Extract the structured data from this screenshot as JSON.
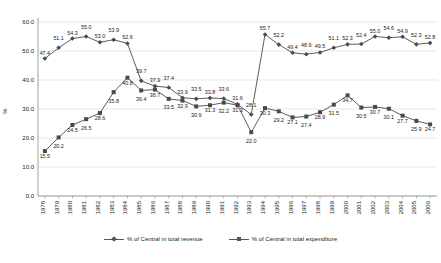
{
  "chart_data": {
    "type": "line",
    "title": "",
    "xlabel": "",
    "ylabel": "%",
    "ylim": [
      0,
      60
    ],
    "yticks": [
      0,
      10,
      20,
      30,
      40,
      50,
      60
    ],
    "ytick_labels": [
      "0.0",
      "10.0",
      "20.0",
      "30.0",
      "40.0",
      "50.0",
      "60.0"
    ],
    "grid": true,
    "legend_position": "bottom",
    "categories": [
      "1978",
      "1979",
      "1980",
      "1981",
      "1982",
      "1983",
      "1984",
      "1985",
      "1986",
      "1987",
      "1988",
      "1989",
      "1990",
      "1991",
      "1992",
      "1993",
      "1994",
      "1995",
      "1996",
      "1997",
      "1998",
      "1999",
      "2000",
      "2001",
      "2002",
      "2003",
      "2004",
      "2005",
      "2006"
    ],
    "series": [
      {
        "name": "% of Central in total revenue",
        "marker": "diamond",
        "color": "#4a4a4a",
        "values": [
          47.4,
          51.1,
          54.3,
          55.0,
          53.0,
          53.9,
          52.6,
          39.7,
          37.9,
          37.4,
          33.9,
          33.5,
          33.8,
          33.6,
          31.6,
          28.1,
          55.7,
          52.2,
          49.4,
          48.9,
          49.5,
          51.1,
          52.3,
          52.4,
          55.0,
          54.6,
          54.9,
          52.3,
          52.8
        ]
      },
      {
        "name": "% of Central in total expenditure",
        "marker": "square",
        "color": "#4a4a4a",
        "values": [
          15.5,
          20.2,
          24.5,
          26.5,
          28.6,
          35.8,
          40.8,
          36.4,
          36.7,
          33.5,
          32.9,
          30.9,
          31.3,
          32.2,
          31.3,
          22.0,
          30.3,
          29.2,
          27.1,
          27.4,
          28.9,
          31.5,
          34.7,
          30.5,
          30.7,
          30.1,
          27.7,
          25.9,
          24.7
        ]
      }
    ],
    "point_labels_revenue": [
      "47.4",
      "51.1",
      "54.3",
      "55.0",
      "53.0",
      "53.9",
      "52.6",
      "39.7",
      "37.9",
      "37.4",
      "33.9",
      "33.5",
      "33.8",
      "33.6",
      "31.6",
      "28.1",
      "55.7",
      "52.2",
      "49.4",
      "48.9",
      "49.5",
      "51.1",
      "52.3",
      "52.4",
      "55.0",
      "54.6",
      "54.9",
      "52.3",
      "52.8"
    ],
    "point_labels_expenditure": [
      "15.5",
      "20.2",
      "24.5",
      "26.5",
      "28.6",
      "35.8",
      "40.8",
      "36.4",
      "36.7",
      "33.5",
      "32.9",
      "30.9",
      "31.3",
      "32.2",
      "31.3",
      "22.0",
      "30.3",
      "29.2",
      "27.1",
      "27.4",
      "28.9",
      "31.5",
      "34.7",
      "30.5",
      "30.7",
      "30.1",
      "27.7",
      "25.9",
      "24.7"
    ]
  },
  "legend": {
    "items": [
      {
        "label": "% of Central in total revenue",
        "marker": "diamond"
      },
      {
        "label": "% of Central in total expenditure",
        "marker": "square"
      }
    ]
  },
  "axis": {
    "y_title": "%"
  },
  "colors": {
    "series": "#4a4a4a",
    "grid": "#d9d9d9",
    "axis": "#888888",
    "text": "#1a1a1a"
  },
  "caption": ""
}
